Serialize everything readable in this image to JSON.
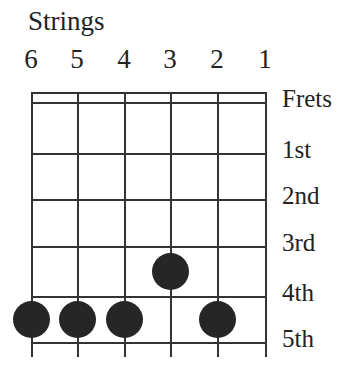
{
  "title": "Strings",
  "strings": [
    "6",
    "5",
    "4",
    "3",
    "2",
    "1"
  ],
  "fret_labels": [
    "Frets",
    "1st",
    "2nd",
    "3rd",
    "4th",
    "5th"
  ],
  "colors": {
    "line": "#333333",
    "dot": "#262626"
  },
  "chart_data": {
    "type": "chord-diagram",
    "title": "Strings",
    "strings": [
      6,
      5,
      4,
      3,
      2,
      1
    ],
    "frets": [
      "1st",
      "2nd",
      "3rd",
      "4th",
      "5th"
    ],
    "fingers": [
      {
        "string": 6,
        "fret": 5
      },
      {
        "string": 5,
        "fret": 5
      },
      {
        "string": 4,
        "fret": 5
      },
      {
        "string": 3,
        "fret": 4
      },
      {
        "string": 2,
        "fret": 5
      }
    ]
  }
}
